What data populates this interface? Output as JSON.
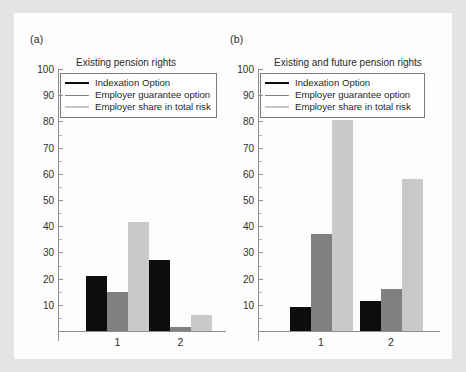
{
  "figure": {
    "panel_a_label": "(a)",
    "panel_b_label": "(b)"
  },
  "legend": {
    "series": [
      {
        "name": "Indexation Option",
        "color": "#0d0d0d",
        "thickness": 2
      },
      {
        "name": "Employer guarantee option",
        "color": "#808080",
        "thickness": 1
      },
      {
        "name": "Employer share in total risk",
        "color": "#c9c9c9",
        "thickness": 2
      }
    ]
  },
  "axis": {
    "yticks": [
      100,
      90,
      80,
      70,
      60,
      50,
      40,
      30,
      20,
      10
    ],
    "ylim": [
      0,
      100
    ],
    "xticks": [
      "1",
      "2"
    ]
  },
  "chart_data": [
    {
      "type": "bar",
      "panel": "(a)",
      "title": "Existing pension rights",
      "categories": [
        "1",
        "2"
      ],
      "series": [
        {
          "name": "Indexation Option",
          "color": "#0d0d0d",
          "values": [
            21,
            27
          ]
        },
        {
          "name": "Employer guarantee option",
          "color": "#808080",
          "values": [
            15,
            1.5
          ]
        },
        {
          "name": "Employer share in total risk",
          "color": "#c9c9c9",
          "values": [
            41.5,
            6
          ]
        }
      ],
      "xlabel": "",
      "ylabel": "",
      "ylim": [
        0,
        100
      ],
      "yticks": [
        10,
        20,
        30,
        40,
        50,
        60,
        70,
        80,
        90,
        100
      ],
      "grid": false,
      "legend_position": "upper-left"
    },
    {
      "type": "bar",
      "panel": "(b)",
      "title": "Existing and future pension rights",
      "categories": [
        "1",
        "2"
      ],
      "series": [
        {
          "name": "Indexation Option",
          "color": "#0d0d0d",
          "values": [
            9,
            11.5
          ]
        },
        {
          "name": "Employer guarantee option",
          "color": "#808080",
          "values": [
            37,
            16
          ]
        },
        {
          "name": "Employer share in total risk",
          "color": "#c9c9c9",
          "values": [
            80.5,
            58
          ]
        }
      ],
      "xlabel": "",
      "ylabel": "",
      "ylim": [
        0,
        100
      ],
      "yticks": [
        10,
        20,
        30,
        40,
        50,
        60,
        70,
        80,
        90,
        100
      ],
      "grid": false,
      "legend_position": "upper-left"
    }
  ]
}
